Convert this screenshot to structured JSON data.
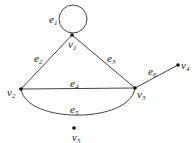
{
  "graph": {
    "vertices": [
      {
        "id": "v1",
        "base": "v",
        "sub": "1",
        "x": 72,
        "y": 35,
        "lx": 68,
        "ly": 48
      },
      {
        "id": "v2",
        "base": "v",
        "sub": "2",
        "x": 21,
        "y": 89,
        "lx": 7,
        "ly": 96
      },
      {
        "id": "v3",
        "base": "v",
        "sub": "3",
        "x": 135,
        "y": 88,
        "lx": 137,
        "ly": 98
      },
      {
        "id": "v4",
        "base": "v",
        "sub": "4",
        "x": 178,
        "y": 65,
        "lx": 181,
        "ly": 69
      },
      {
        "id": "v5",
        "base": "v",
        "sub": "5",
        "x": 74,
        "y": 128,
        "lx": 72,
        "ly": 141
      }
    ],
    "edges": [
      {
        "id": "e1",
        "base": "e",
        "sub": "1",
        "from": "v1",
        "to": "v1",
        "type": "loop",
        "lx": 49,
        "ly": 23
      },
      {
        "id": "e2",
        "base": "e",
        "sub": "2",
        "from": "v1",
        "to": "v2",
        "type": "line",
        "lx": 34,
        "ly": 62
      },
      {
        "id": "e3",
        "base": "e",
        "sub": "3",
        "from": "v1",
        "to": "v3",
        "type": "line",
        "lx": 107,
        "ly": 62
      },
      {
        "id": "e4",
        "base": "e",
        "sub": "4",
        "from": "v2",
        "to": "v3",
        "type": "line",
        "lx": 70,
        "ly": 88
      },
      {
        "id": "e5",
        "base": "e",
        "sub": "5",
        "from": "v2",
        "to": "v3",
        "type": "arc",
        "lx": 70,
        "ly": 113
      },
      {
        "id": "e6",
        "base": "e",
        "sub": "6",
        "from": "v3",
        "to": "v4",
        "type": "line",
        "lx": 148,
        "ly": 75
      }
    ]
  }
}
